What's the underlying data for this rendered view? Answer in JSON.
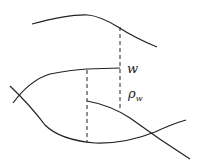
{
  "diagram": {
    "labels": {
      "w": "w",
      "rho": "ρ",
      "rho_sub": "w"
    }
  }
}
